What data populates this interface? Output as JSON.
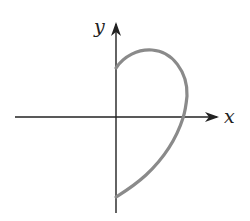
{
  "figure": {
    "type": "parametric-curve-sketch",
    "axes": {
      "x_label": "x",
      "y_label": "y",
      "axis_color": "#222222"
    },
    "curve": {
      "description": "Closed-looking loop starting on the positive y-axis, bulging right across the positive x-axis, ending on the negative y-axis",
      "color": "#8a8a8a",
      "start_point": "positive y-axis",
      "end_point": "negative y-axis",
      "crosses_positive_x_axis": true
    }
  }
}
